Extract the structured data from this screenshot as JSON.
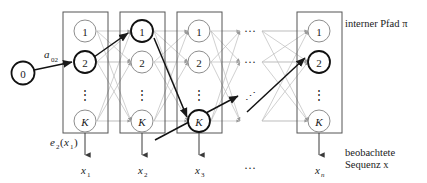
{
  "figure": {
    "title_alt": "HMM trellis diagram",
    "background_color": "#ffffff",
    "line_color_faint": "#b9b9b9",
    "line_color_mid": "#9a9a9a",
    "line_color_dark": "#1a1a1a",
    "node_stroke_faint": "#8d8d8d",
    "node_stroke_bold": "#111111",
    "box_stroke": "#4a4a4a"
  },
  "annotations": {
    "internal_path": "interner Pfad π",
    "observed_sequence_line1": "beobachtete",
    "observed_sequence_line2": "Sequenz x",
    "emission_label": "e",
    "emission_sub": "2",
    "emission_arg_open": "(x",
    "emission_arg_sub": "1",
    "emission_arg_close": ")",
    "transition_label": "a",
    "transition_sub": "02"
  },
  "start_node": {
    "label": "0",
    "cx": 23,
    "cy": 73,
    "r": 11.5,
    "bold": true
  },
  "columns": [
    {
      "id": "col-1",
      "x": 63,
      "width": 45,
      "output_label": "x",
      "output_sub": "1",
      "nodes": [
        {
          "label": "1",
          "cy": 31,
          "bold": false
        },
        {
          "label": "2",
          "cy": 62,
          "bold": true
        },
        {
          "label": "⋮",
          "cy": 95,
          "bold": false,
          "is_dots": true
        },
        {
          "label": "K",
          "cy": 121,
          "bold": false
        }
      ]
    },
    {
      "id": "col-2",
      "x": 120,
      "width": 45,
      "output_label": "x",
      "output_sub": "2",
      "nodes": [
        {
          "label": "1",
          "cy": 31,
          "bold": true
        },
        {
          "label": "2",
          "cy": 62,
          "bold": false
        },
        {
          "label": "⋮",
          "cy": 95,
          "bold": false,
          "is_dots": true
        },
        {
          "label": "K",
          "cy": 121,
          "bold": false
        }
      ]
    },
    {
      "id": "col-3",
      "x": 177,
      "width": 45,
      "output_label": "x",
      "output_sub": "3",
      "nodes": [
        {
          "label": "1",
          "cy": 31,
          "bold": false
        },
        {
          "label": "2",
          "cy": 62,
          "bold": false
        },
        {
          "label": "⋮",
          "cy": 95,
          "bold": false,
          "is_dots": true
        },
        {
          "label": "K",
          "cy": 121,
          "bold": true
        }
      ]
    },
    {
      "id": "col-n",
      "x": 297,
      "width": 45,
      "output_label": "x",
      "output_sub": "n",
      "nodes": [
        {
          "label": "1",
          "cy": 31,
          "bold": false
        },
        {
          "label": "2",
          "cy": 62,
          "bold": true
        },
        {
          "label": "⋮",
          "cy": 95,
          "bold": false,
          "is_dots": true
        },
        {
          "label": "K",
          "cy": 121,
          "bold": false
        }
      ]
    }
  ],
  "gap_ellipses": [
    {
      "text": "···",
      "x": 248,
      "y": 34
    },
    {
      "text": "···",
      "x": 248,
      "y": 65
    },
    {
      "text": "⋰",
      "x": 248,
      "y": 98
    },
    {
      "text": "···",
      "x": 248,
      "y": 168
    }
  ],
  "box": {
    "top": 12,
    "bottom": 133
  },
  "bold_path": {
    "description": "Viterbi path through states",
    "points": [
      {
        "col": "start",
        "state": "0"
      },
      {
        "col": "col-1",
        "state": "2"
      },
      {
        "col": "col-2",
        "state": "1"
      },
      {
        "col": "col-3",
        "state": "K"
      },
      {
        "col": "gap",
        "state": "-"
      },
      {
        "col": "col-n",
        "state": "2"
      }
    ]
  }
}
